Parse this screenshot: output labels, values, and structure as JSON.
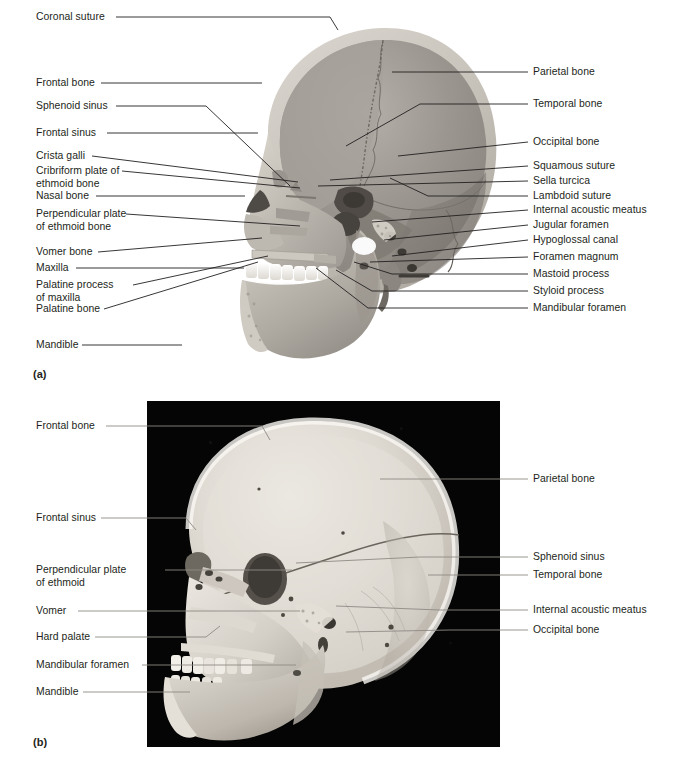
{
  "figure": {
    "panels": [
      {
        "id": "a",
        "letter": "(a)",
        "kind": "illustration"
      },
      {
        "id": "b",
        "letter": "(b)",
        "kind": "photograph"
      }
    ]
  },
  "panel_a": {
    "letter": "(a)",
    "labels_left": [
      {
        "text": "Coronal suture"
      },
      {
        "text": "Frontal bone"
      },
      {
        "text": "Sphenoid sinus"
      },
      {
        "text": "Frontal sinus"
      },
      {
        "text": "Crista galli"
      },
      {
        "text": "Cribriform plate of\nethmoid bone"
      },
      {
        "text": "Nasal bone"
      },
      {
        "text": "Perpendicular plate\nof ethmoid bone"
      },
      {
        "text": "Vomer bone"
      },
      {
        "text": "Maxilla"
      },
      {
        "text": "Palatine process\nof maxilla"
      },
      {
        "text": "Palatine bone"
      },
      {
        "text": "Mandible"
      }
    ],
    "labels_right": [
      {
        "text": "Parietal bone"
      },
      {
        "text": "Temporal bone"
      },
      {
        "text": "Occipital bone"
      },
      {
        "text": "Squamous suture"
      },
      {
        "text": "Sella turcica"
      },
      {
        "text": "Lambdoid suture"
      },
      {
        "text": "Internal acoustic meatus"
      },
      {
        "text": "Jugular foramen"
      },
      {
        "text": "Hypoglossal canal"
      },
      {
        "text": "Foramen magnum"
      },
      {
        "text": "Mastoid process"
      },
      {
        "text": "Styloid process"
      },
      {
        "text": "Mandibular foramen"
      }
    ]
  },
  "panel_b": {
    "letter": "(b)",
    "labels_left": [
      {
        "text": "Frontal bone"
      },
      {
        "text": "Frontal sinus"
      },
      {
        "text": "Perpendicular plate\nof ethmoid"
      },
      {
        "text": "Vomer"
      },
      {
        "text": "Hard palate"
      },
      {
        "text": "Mandibular foramen"
      },
      {
        "text": "Mandible"
      }
    ],
    "labels_right": [
      {
        "text": "Parietal bone"
      },
      {
        "text": "Sphenoid sinus"
      },
      {
        "text": "Temporal bone"
      },
      {
        "text": "Internal acoustic meatus"
      },
      {
        "text": "Occipital bone"
      }
    ]
  },
  "colors": {
    "background": "#ffffff",
    "text": "#231f20",
    "leader_line": "#231f20",
    "leader_line_photo": "#8c8c8c",
    "photo_background": "#050505",
    "bone_light": "#e8e4dd",
    "bone_mid": "#b9b4ac",
    "bone_dark": "#8f8a82",
    "cavity_dark": "#4a4641"
  }
}
